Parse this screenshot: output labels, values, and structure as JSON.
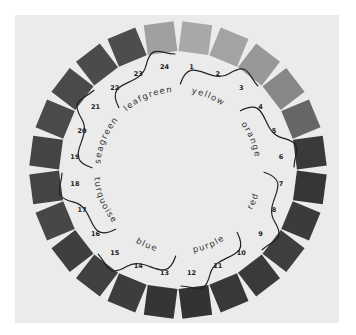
{
  "background_color": "#ffffff",
  "card_color": "#ebebeb",
  "swatches": [
    {
      "number": "1",
      "color": "#a8a8a8"
    },
    {
      "number": "2",
      "color": "#a3a3a3"
    },
    {
      "number": "3",
      "color": "#989898"
    },
    {
      "number": "4",
      "color": "#878787"
    },
    {
      "number": "5",
      "color": "#666666"
    },
    {
      "number": "6",
      "color": "#3a3a3a"
    },
    {
      "number": "7",
      "color": "#363636"
    },
    {
      "number": "8",
      "color": "#3b3b3b"
    },
    {
      "number": "9",
      "color": "#3e3e3e"
    },
    {
      "number": "10",
      "color": "#3a3a3a"
    },
    {
      "number": "11",
      "color": "#383838"
    },
    {
      "number": "12",
      "color": "#333333"
    },
    {
      "number": "13",
      "color": "#353535"
    },
    {
      "number": "14",
      "color": "#3d3d3d"
    },
    {
      "number": "15",
      "color": "#404040"
    },
    {
      "number": "16",
      "color": "#3f3f3f"
    },
    {
      "number": "17",
      "color": "#474747"
    },
    {
      "number": "18",
      "color": "#444444"
    },
    {
      "number": "19",
      "color": "#454545"
    },
    {
      "number": "20",
      "color": "#4a4a4a"
    },
    {
      "number": "21",
      "color": "#4a4a4a"
    },
    {
      "number": "22",
      "color": "#4b4b4b"
    },
    {
      "number": "23",
      "color": "#4d4d4d"
    },
    {
      "number": "24",
      "color": "#a0a0a0"
    }
  ],
  "groups": [
    {
      "label": "yellow",
      "hues": [
        "1",
        "2",
        "3"
      ]
    },
    {
      "label": "orange",
      "hues": [
        "4",
        "5",
        "6"
      ]
    },
    {
      "label": "red",
      "hues": [
        "7",
        "8",
        "9"
      ]
    },
    {
      "label": "purple",
      "hues": [
        "10",
        "11",
        "12"
      ]
    },
    {
      "label": "blue",
      "hues": [
        "13",
        "14",
        "15"
      ]
    },
    {
      "label": "turquoise",
      "hues": [
        "16",
        "17",
        "18"
      ]
    },
    {
      "label": "seagreen",
      "hues": [
        "19",
        "20",
        "21"
      ]
    },
    {
      "label": "leafgreen",
      "hues": [
        "22",
        "23",
        "24"
      ]
    }
  ],
  "divider_color": "#222222",
  "text_color": "#333333"
}
